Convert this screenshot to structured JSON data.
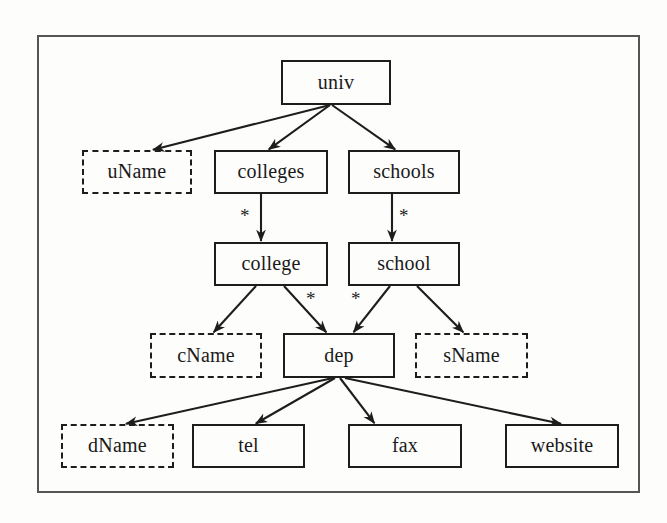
{
  "diagram": {
    "frame": {
      "x": 37,
      "y": 35,
      "width": 603,
      "height": 458,
      "border_color": "#555555"
    },
    "style": {
      "solid_border_color": "#1d1d1d",
      "dashed_border_color": "#1d1d1d",
      "edge_color": "#1d1d1d",
      "background": "#fdfdfb",
      "text_color": "#1a1a1a"
    },
    "nodes": [
      {
        "id": "univ",
        "label": "univ",
        "shape": "solid",
        "x": 281,
        "y": 60,
        "w": 110,
        "h": 45
      },
      {
        "id": "uName",
        "label": "uName",
        "shape": "dashed",
        "x": 82,
        "y": 150,
        "w": 110,
        "h": 44
      },
      {
        "id": "colleges",
        "label": "colleges",
        "shape": "solid",
        "x": 214,
        "y": 150,
        "w": 114,
        "h": 44
      },
      {
        "id": "schools",
        "label": "schools",
        "shape": "solid",
        "x": 348,
        "y": 150,
        "w": 112,
        "h": 44
      },
      {
        "id": "college",
        "label": "college",
        "shape": "solid",
        "x": 214,
        "y": 242,
        "w": 114,
        "h": 44
      },
      {
        "id": "school",
        "label": "school",
        "shape": "solid",
        "x": 348,
        "y": 242,
        "w": 112,
        "h": 44
      },
      {
        "id": "cName",
        "label": "cName",
        "shape": "dashed",
        "x": 150,
        "y": 333,
        "w": 112,
        "h": 45
      },
      {
        "id": "dep",
        "label": "dep",
        "shape": "solid",
        "x": 283,
        "y": 333,
        "w": 112,
        "h": 45
      },
      {
        "id": "sName",
        "label": "sName",
        "shape": "dashed",
        "x": 415,
        "y": 333,
        "w": 113,
        "h": 45
      },
      {
        "id": "dName",
        "label": "dName",
        "shape": "dashed",
        "x": 61,
        "y": 424,
        "w": 113,
        "h": 44
      },
      {
        "id": "tel",
        "label": "tel",
        "shape": "solid",
        "x": 192,
        "y": 424,
        "w": 113,
        "h": 44
      },
      {
        "id": "fax",
        "label": "fax",
        "shape": "solid",
        "x": 348,
        "y": 424,
        "w": 114,
        "h": 44
      },
      {
        "id": "website",
        "label": "website",
        "shape": "solid",
        "x": 505,
        "y": 424,
        "w": 114,
        "h": 44
      }
    ],
    "edges": [
      {
        "from": "univ",
        "to": "uName",
        "x1": 330,
        "y1": 105,
        "x2": 152,
        "y2": 150,
        "multiplicity": ""
      },
      {
        "from": "univ",
        "to": "colleges",
        "x1": 330,
        "y1": 105,
        "x2": 268,
        "y2": 150,
        "multiplicity": ""
      },
      {
        "from": "univ",
        "to": "schools",
        "x1": 332,
        "y1": 105,
        "x2": 396,
        "y2": 150,
        "multiplicity": ""
      },
      {
        "from": "colleges",
        "to": "college",
        "x1": 261,
        "y1": 194,
        "x2": 261,
        "y2": 242,
        "multiplicity": "*"
      },
      {
        "from": "schools",
        "to": "school",
        "x1": 392,
        "y1": 194,
        "x2": 392,
        "y2": 242,
        "multiplicity": "*"
      },
      {
        "from": "college",
        "to": "cName",
        "x1": 256,
        "y1": 286,
        "x2": 213,
        "y2": 333,
        "multiplicity": ""
      },
      {
        "from": "college",
        "to": "dep",
        "x1": 284,
        "y1": 286,
        "x2": 327,
        "y2": 333,
        "multiplicity": "*"
      },
      {
        "from": "school",
        "to": "dep",
        "x1": 390,
        "y1": 286,
        "x2": 353,
        "y2": 333,
        "multiplicity": "*"
      },
      {
        "from": "school",
        "to": "sName",
        "x1": 417,
        "y1": 286,
        "x2": 464,
        "y2": 333,
        "multiplicity": ""
      },
      {
        "from": "dep",
        "to": "dName",
        "x1": 333,
        "y1": 378,
        "x2": 125,
        "y2": 424,
        "multiplicity": ""
      },
      {
        "from": "dep",
        "to": "tel",
        "x1": 335,
        "y1": 378,
        "x2": 255,
        "y2": 424,
        "multiplicity": ""
      },
      {
        "from": "dep",
        "to": "fax",
        "x1": 340,
        "y1": 378,
        "x2": 375,
        "y2": 424,
        "multiplicity": ""
      },
      {
        "from": "dep",
        "to": "website",
        "x1": 345,
        "y1": 378,
        "x2": 562,
        "y2": 424,
        "multiplicity": ""
      }
    ],
    "multiplicity_markers": [
      {
        "label": "*",
        "x": 240,
        "y": 206,
        "edge": "colleges-college"
      },
      {
        "label": "*",
        "x": 399,
        "y": 206,
        "edge": "schools-school"
      },
      {
        "label": "*",
        "x": 306,
        "y": 289,
        "edge": "college-dep"
      },
      {
        "label": "*",
        "x": 351,
        "y": 289,
        "edge": "school-dep"
      }
    ]
  }
}
